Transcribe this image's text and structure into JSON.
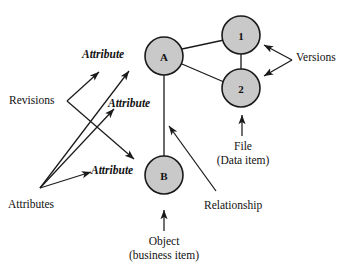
{
  "diagram": {
    "title_text": "",
    "colors": {
      "node_fill": "#c9c9c9",
      "node_stroke": "#1a1a1a",
      "line": "#1a1a1a",
      "text": "#111111",
      "background": "#ffffff"
    },
    "nodes": [
      {
        "id": "A",
        "label": "A",
        "cx": 164,
        "cy": 56,
        "r": 19
      },
      {
        "id": "B",
        "label": "B",
        "cx": 164,
        "cy": 175,
        "r": 19
      },
      {
        "id": "V1",
        "label": "1",
        "cx": 241,
        "cy": 35,
        "r": 19
      },
      {
        "id": "V2",
        "label": "2",
        "cx": 241,
        "cy": 88,
        "r": 19
      }
    ],
    "edges": [
      {
        "from": "A",
        "to": "V1"
      },
      {
        "from": "A",
        "to": "V2"
      },
      {
        "from": "V1",
        "to": "V2"
      },
      {
        "from": "A",
        "to": "B"
      }
    ],
    "attribute_labels": [
      {
        "name": "attribute-label-top",
        "text": "Attribute",
        "x": 82,
        "y": 48
      },
      {
        "name": "attribute-label-middle",
        "text": "Attribute",
        "x": 108,
        "y": 97
      },
      {
        "name": "attribute-label-bottom",
        "text": "Attribute",
        "x": 91,
        "y": 164
      }
    ],
    "annotations": [
      {
        "name": "revisions-label",
        "text": "Revisions",
        "x": 9,
        "y": 94
      },
      {
        "name": "attributes-label",
        "text": "Attributes",
        "x": 8,
        "y": 198
      },
      {
        "name": "versions-label",
        "text": "Versions",
        "x": 296,
        "y": 51
      },
      {
        "name": "relationship-label",
        "text": "Relationship",
        "x": 204,
        "y": 199
      }
    ],
    "captions": [
      {
        "name": "file-caption",
        "lines": [
          "File",
          "(Data item)"
        ],
        "x": 200,
        "y": 139,
        "width": 86
      },
      {
        "name": "object-caption",
        "lines": [
          "Object",
          "(business item)"
        ],
        "x": 112,
        "y": 234,
        "width": 104
      }
    ]
  }
}
